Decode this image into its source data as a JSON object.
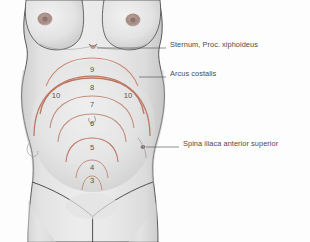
{
  "figure": {
    "view": "anterior torso, female",
    "background_color": "#fdfdfd",
    "skin_fill": "#e6e6e6",
    "skin_shadow": "#c9c9c9",
    "outline_color": "#3c3c3c",
    "arc_color": "#b9705c",
    "arc_color_light": "#d3a091",
    "label_color": "#4b4b4b",
    "number_color": "#5c5148",
    "leader_color": "#555555"
  },
  "labels": [
    {
      "id": "sternum",
      "text": "Sternum, Proc. xiphoideus",
      "text_x": 168,
      "text_y": 44,
      "leader_x1": 166,
      "leader_y1": 48,
      "leader_x2": 96,
      "leader_y2": 48,
      "marker_x": 94,
      "marker_y": 47
    },
    {
      "id": "arcus-costalis",
      "text": "Arcus costalis",
      "text_x": 168,
      "text_y": 73,
      "leader_x1": 166,
      "leader_y1": 77,
      "leader_x2": 139,
      "leader_y2": 77,
      "marker_x": 137,
      "marker_y": 77
    },
    {
      "id": "spina-iliaca",
      "text": "Spina iliaca anterior superior",
      "text_x": 181,
      "text_y": 143,
      "leader_x1": 179,
      "leader_y1": 147,
      "leader_x2": 146,
      "leader_y2": 147,
      "marker_x": 144,
      "marker_y": 147
    }
  ],
  "fundal_markers": [
    {
      "label": "9",
      "x": 92,
      "y": 70
    },
    {
      "label": "8",
      "x": 92,
      "y": 88
    },
    {
      "label": "7",
      "x": 92,
      "y": 105
    },
    {
      "label": "6",
      "x": 92,
      "y": 124
    },
    {
      "label": "5",
      "x": 92,
      "y": 148
    },
    {
      "label": "4",
      "x": 92,
      "y": 168
    },
    {
      "label": "3",
      "x": 92,
      "y": 181
    },
    {
      "label": "10",
      "x": 56,
      "y": 96
    },
    {
      "label": "10",
      "x": 128,
      "y": 96
    }
  ],
  "arcs": [
    {
      "id": "arc-9",
      "cx": 92,
      "cy": 131,
      "rx": 46,
      "ry": 62,
      "sweep_deg": 170,
      "color": "#c88470",
      "width": 1.1
    },
    {
      "id": "arc-8",
      "cx": 92,
      "cy": 131,
      "rx": 52,
      "ry": 46,
      "sweep_deg": 175,
      "color": "#b9705c",
      "width": 1.3
    },
    {
      "id": "arc-7",
      "cx": 92,
      "cy": 131,
      "rx": 43,
      "ry": 28,
      "sweep_deg": 175,
      "color": "#c08a78",
      "width": 1.0
    },
    {
      "id": "arc-6",
      "cx": 92,
      "cy": 140,
      "rx": 36,
      "ry": 19,
      "sweep_deg": 175,
      "color": "#c08a78",
      "width": 1.0
    },
    {
      "id": "arc-5",
      "cx": 92,
      "cy": 158,
      "rx": 30,
      "ry": 16,
      "sweep_deg": 175,
      "color": "#b9705c",
      "width": 1.1
    },
    {
      "id": "arc-4",
      "cx": 92,
      "cy": 176,
      "rx": 18,
      "ry": 12,
      "sweep_deg": 175,
      "color": "#c08a78",
      "width": 1.0
    },
    {
      "id": "arc-3",
      "cx": 92,
      "cy": 187,
      "rx": 11,
      "ry": 9,
      "sweep_deg": 175,
      "color": "#c08a78",
      "width": 1.0
    },
    {
      "id": "arc-10",
      "cx": 92,
      "cy": 133,
      "rx": 58,
      "ry": 52,
      "sweep_deg": 180,
      "color": "#b9705c",
      "width": 1.2
    }
  ]
}
